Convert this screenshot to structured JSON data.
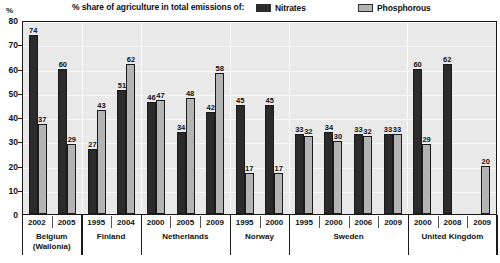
{
  "header": {
    "title": "% share of agriculture in total emissions of:",
    "legend": [
      {
        "label": "Nitrates",
        "color": "#2b2b2b",
        "icon": "legend-swatch-dark"
      },
      {
        "label": "Phosphorous",
        "color": "#b4b4b4",
        "icon": "legend-swatch-light"
      }
    ]
  },
  "axis": {
    "y_unit": "%",
    "y_ticks": [
      "80",
      "70",
      "60",
      "50",
      "40",
      "30",
      "20",
      "10",
      "0"
    ]
  },
  "chart_data": {
    "type": "bar",
    "title": "% share of agriculture in total emissions of:",
    "xlabel": "",
    "ylabel": "%",
    "ylim": [
      0,
      80
    ],
    "ytick_step": 10,
    "grid": true,
    "legend_position": "top",
    "categories": [
      "2002",
      "2005",
      "1995",
      "2004",
      "2000",
      "2005",
      "2009",
      "1995",
      "2000",
      "1995",
      "2000",
      "2006",
      "2009",
      "2000",
      "2008",
      "2009"
    ],
    "series": [
      {
        "name": "Nitrates",
        "values": [
          74,
          60,
          27,
          51,
          46,
          34,
          42,
          45,
          45,
          33,
          34,
          33,
          33,
          60,
          62,
          null
        ]
      },
      {
        "name": "Phosphorous",
        "values": [
          37,
          29,
          43,
          62,
          47,
          48,
          58,
          17,
          17,
          32,
          30,
          32,
          33,
          29,
          null,
          20
        ]
      }
    ],
    "groups": [
      {
        "country": "Belgium\n(Wallonia)",
        "years": [
          "2002",
          "2005"
        ]
      },
      {
        "country": "Finland",
        "years": [
          "1995",
          "2004"
        ]
      },
      {
        "country": "Netherlands",
        "years": [
          "2000",
          "2005",
          "2009"
        ]
      },
      {
        "country": "Norway",
        "years": [
          "1995",
          "2000"
        ]
      },
      {
        "country": "Sweden",
        "years": [
          "1995",
          "2000",
          "2006",
          "2009"
        ]
      },
      {
        "country": "United Kingdom",
        "years": [
          "2000",
          "2008",
          "2009"
        ]
      }
    ]
  },
  "countries": [
    {
      "name_line1": "Belgium",
      "name_line2": "(Wallonia)",
      "bars": [
        {
          "year": "2002",
          "nitrates": 74,
          "phosphorous": 37
        },
        {
          "year": "2005",
          "nitrates": 60,
          "phosphorous": 29
        }
      ]
    },
    {
      "name_line1": "Finland",
      "name_line2": "",
      "bars": [
        {
          "year": "1995",
          "nitrates": 27,
          "phosphorous": 43
        },
        {
          "year": "2004",
          "nitrates": 51,
          "phosphorous": 62
        }
      ]
    },
    {
      "name_line1": "Netherlands",
      "name_line2": "",
      "bars": [
        {
          "year": "2000",
          "nitrates": 46,
          "phosphorous": 47
        },
        {
          "year": "2005",
          "nitrates": 34,
          "phosphorous": 48
        },
        {
          "year": "2009",
          "nitrates": 42,
          "phosphorous": 58
        }
      ]
    },
    {
      "name_line1": "Norway",
      "name_line2": "",
      "bars": [
        {
          "year": "1995",
          "nitrates": 45,
          "phosphorous": 17
        },
        {
          "year": "2000",
          "nitrates": 45,
          "phosphorous": 17
        }
      ]
    },
    {
      "name_line1": "Sweden",
      "name_line2": "",
      "bars": [
        {
          "year": "1995",
          "nitrates": 33,
          "phosphorous": 32
        },
        {
          "year": "2000",
          "nitrates": 34,
          "phosphorous": 30
        },
        {
          "year": "2006",
          "nitrates": 33,
          "phosphorous": 32
        },
        {
          "year": "2009",
          "nitrates": 33,
          "phosphorous": 33
        }
      ]
    },
    {
      "name_line1": "United Kingdom",
      "name_line2": "",
      "bars": [
        {
          "year": "2000",
          "nitrates": 60,
          "phosphorous": 29
        },
        {
          "year": "2008",
          "nitrates": 62,
          "phosphorous": null
        },
        {
          "year": "2009",
          "nitrates": null,
          "phosphorous": 20
        }
      ]
    }
  ]
}
